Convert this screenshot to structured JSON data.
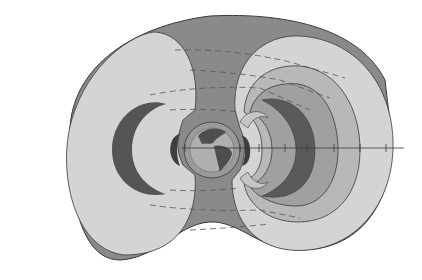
{
  "diagram": {
    "labels": [],
    "colors": {
      "background": "#ffffff",
      "outer_torus": "#8a8a8a",
      "lobe_light": "#d4d4d4",
      "zone_mid_light": "#b8b8b8",
      "zone_mid": "#a0a0a0",
      "zone_dark": "#5a5a5a",
      "earth_ring": "#9a9a9a",
      "earth_disk": "#b0b0b0",
      "continents": "#4e4e4e",
      "outline": "#3a3a3a",
      "dashes": "#555555"
    },
    "axis": {
      "orientation": "horizontal",
      "tick_count": 8
    }
  }
}
